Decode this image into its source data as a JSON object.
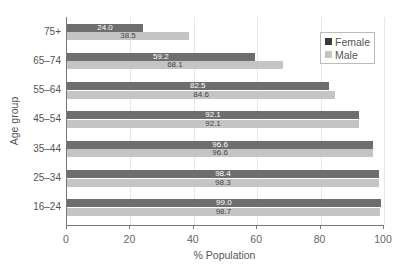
{
  "chart_data": {
    "type": "bar",
    "orientation": "horizontal",
    "title": "",
    "xlabel": "% Population",
    "ylabel": "Age group",
    "xlim": [
      0,
      100
    ],
    "xticks": [
      "0",
      "20",
      "40",
      "60",
      "80",
      "100"
    ],
    "categories": [
      "75+",
      "65–74",
      "55–64",
      "45–54",
      "35–44",
      "25–34",
      "16–24"
    ],
    "series": [
      {
        "name": "Female",
        "color": "#6e6e6e",
        "values": [
          24.0,
          59.2,
          82.5,
          92.1,
          96.6,
          98.4,
          99.0
        ]
      },
      {
        "name": "Male",
        "color": "#c4c4c4",
        "values": [
          38.5,
          68.1,
          84.6,
          92.1,
          96.6,
          98.3,
          98.7
        ]
      }
    ],
    "value_labels": {
      "Female": [
        "24.0",
        "59.2",
        "82.5",
        "92.1",
        "96.6",
        "98.4",
        "99.0"
      ],
      "Male": [
        "38.5",
        "68.1",
        "84.6",
        "92.1",
        "96.6",
        "98.3",
        "98.7"
      ]
    },
    "legend": {
      "position": "upper right",
      "entries": [
        "Female",
        "Male"
      ]
    },
    "grid": {
      "x": true,
      "y": false
    }
  }
}
